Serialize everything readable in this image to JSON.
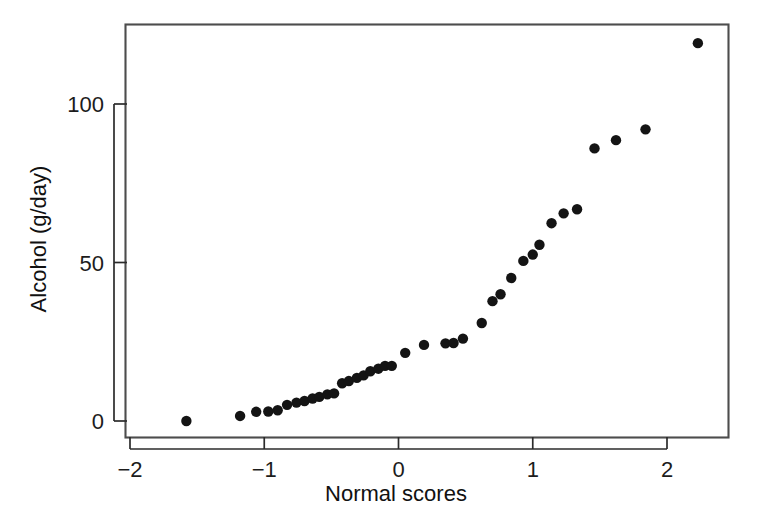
{
  "chart_data": {
    "type": "scatter",
    "title": "",
    "xlabel": "Normal scores",
    "ylabel": "Alcohol (g/day)",
    "xlim": [
      -2.1,
      2.45
    ],
    "ylim": [
      -4,
      130
    ],
    "xticks": [
      -2,
      -1,
      0,
      1,
      2
    ],
    "xtick_labels": [
      "−2",
      "−1",
      "0",
      "1",
      "2"
    ],
    "yticks": [
      0,
      50,
      100
    ],
    "ytick_labels": [
      "0",
      "50",
      "100"
    ],
    "grid": false,
    "legend": null,
    "marker": "filled-circle",
    "marker_color": "#141414",
    "marker_size": 5.2,
    "n_points": 37,
    "x": [
      -1.58,
      -1.18,
      -1.06,
      -0.97,
      -0.9,
      -0.83,
      -0.76,
      -0.7,
      -0.64,
      -0.59,
      -0.53,
      -0.48,
      -0.42,
      -0.37,
      -0.31,
      -0.26,
      -0.21,
      -0.15,
      -0.1,
      -0.05,
      0.05,
      0.19,
      0.35,
      0.41,
      0.48,
      0.62,
      0.7,
      0.76,
      0.84,
      0.93,
      1.0,
      1.1,
      1.2,
      1.32,
      1.43,
      1.62,
      1.84,
      2.23
    ],
    "y": [
      0.0,
      1.6,
      2.9,
      3.0,
      3.4,
      5.1,
      5.8,
      6.3,
      7.1,
      7.6,
      8.4,
      8.7,
      9.1,
      11.9,
      12.6,
      13.6,
      14.4,
      15.7,
      16.5,
      17.4,
      21.5,
      24.0,
      24.5,
      24.6,
      26.0,
      30.9,
      37.8,
      40.0,
      45.1,
      50.5,
      52.5,
      55.6,
      62.4,
      65.5,
      66.8,
      86.0,
      88.6,
      92.0,
      119.2
    ],
    "points": [
      {
        "x": -1.58,
        "y": 0.0
      },
      {
        "x": -1.18,
        "y": 1.6
      },
      {
        "x": -1.06,
        "y": 2.9
      },
      {
        "x": -0.97,
        "y": 3.0
      },
      {
        "x": -0.9,
        "y": 3.4
      },
      {
        "x": -0.83,
        "y": 5.1
      },
      {
        "x": -0.76,
        "y": 5.8
      },
      {
        "x": -0.7,
        "y": 6.3
      },
      {
        "x": -0.64,
        "y": 7.1
      },
      {
        "x": -0.59,
        "y": 7.6
      },
      {
        "x": -0.53,
        "y": 8.4
      },
      {
        "x": -0.48,
        "y": 8.7
      },
      {
        "x": -0.42,
        "y": 11.9
      },
      {
        "x": -0.37,
        "y": 12.6
      },
      {
        "x": -0.31,
        "y": 13.6
      },
      {
        "x": -0.26,
        "y": 14.4
      },
      {
        "x": -0.21,
        "y": 15.7
      },
      {
        "x": -0.15,
        "y": 16.5
      },
      {
        "x": -0.1,
        "y": 17.4
      },
      {
        "x": -0.05,
        "y": 17.4
      },
      {
        "x": 0.05,
        "y": 21.5
      },
      {
        "x": 0.19,
        "y": 24.0
      },
      {
        "x": 0.35,
        "y": 24.5
      },
      {
        "x": 0.41,
        "y": 24.6
      },
      {
        "x": 0.48,
        "y": 26.0
      },
      {
        "x": 0.62,
        "y": 30.9
      },
      {
        "x": 0.7,
        "y": 37.8
      },
      {
        "x": 0.76,
        "y": 40.0
      },
      {
        "x": 0.84,
        "y": 45.1
      },
      {
        "x": 0.93,
        "y": 50.5
      },
      {
        "x": 1.0,
        "y": 52.5
      },
      {
        "x": 1.05,
        "y": 55.6
      },
      {
        "x": 1.14,
        "y": 62.4
      },
      {
        "x": 1.23,
        "y": 65.5
      },
      {
        "x": 1.33,
        "y": 66.8
      },
      {
        "x": 1.46,
        "y": 86.0
      },
      {
        "x": 1.62,
        "y": 88.6
      },
      {
        "x": 1.84,
        "y": 92.0
      },
      {
        "x": 2.23,
        "y": 119.2
      }
    ]
  },
  "figure": {
    "background_color": "#ffffff",
    "frame_color": "#4d4d4d",
    "axis_color": "#2b2b2b",
    "text_color": "#1a1a1a"
  }
}
